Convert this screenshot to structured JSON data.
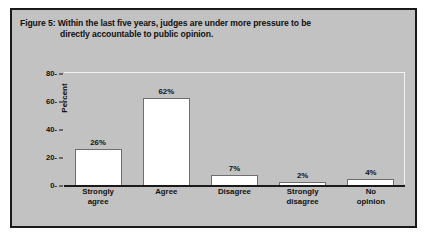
{
  "figure": {
    "title_line1": "Figure 5: Within the last five years, judges are under more pressure to be",
    "title_line2": "directly accountable to public opinion."
  },
  "colors": {
    "frame_background": "#c2c2c2",
    "frame_border": "#1a1a1a",
    "bar_fill": "#ffffff",
    "bar_outline": "#6e6e6e",
    "text": "#111111",
    "plot_highlight_border": "#f2f2f2"
  },
  "chart_data": {
    "type": "bar",
    "title": "Figure 5: Within the last five years, judges are under more pressure to be directly accountable to public opinion.",
    "xlabel": "",
    "ylabel": "Percent",
    "ylim": [
      0,
      80
    ],
    "yticks": [
      "0-",
      "20-",
      "40-",
      "60-",
      "80-"
    ],
    "ytick_values": [
      0,
      20,
      40,
      60,
      80
    ],
    "grid": false,
    "legend": "none",
    "categories": [
      "Strongly agree",
      "Agree",
      "Disagree",
      "Strongly disagree",
      "No opinion"
    ],
    "category_lines": [
      {
        "l1": "Strongly",
        "l2": "agree"
      },
      {
        "l1": "Agree",
        "l2": ""
      },
      {
        "l1": "Disagree",
        "l2": ""
      },
      {
        "l1": "Strongly",
        "l2": "disagree"
      },
      {
        "l1": "No",
        "l2": "opinion"
      }
    ],
    "values": [
      26,
      62,
      7,
      2,
      4
    ],
    "value_labels": [
      "26%",
      "62%",
      "7%",
      "2%",
      "4%"
    ]
  }
}
